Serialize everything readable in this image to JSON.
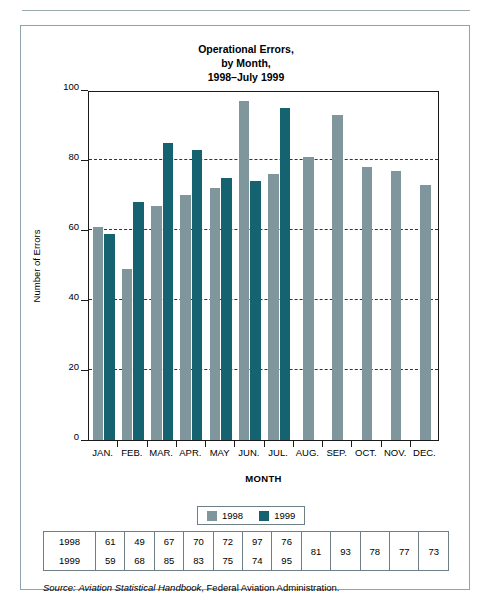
{
  "figure": {
    "title_lines": [
      "Operational Errors,",
      "by Month,",
      "1998–July 1999"
    ],
    "source_prefix": "Source:",
    "source_italic": "Aviation Statistical Handbook",
    "source_rest": ", Federal Aviation Administration."
  },
  "legend": {
    "items": [
      {
        "label": "1998",
        "color": "#7f979c"
      },
      {
        "label": "1999",
        "color": "#156370"
      }
    ]
  },
  "table": {
    "row_labels": [
      "1998",
      "1999"
    ],
    "row_1998": [
      "61",
      "49",
      "67",
      "70",
      "72",
      "97",
      "76",
      "81",
      "93",
      "78",
      "77",
      "73"
    ],
    "row_1999": [
      "59",
      "68",
      "85",
      "83",
      "75",
      "74",
      "95"
    ]
  },
  "chart_data": {
    "type": "bar",
    "title": "Operational Errors, by Month, 1998–July 1999",
    "xlabel": "MONTH",
    "ylabel": "Number of Errors",
    "categories": [
      "JAN.",
      "FEB.",
      "MAR.",
      "APR.",
      "MAY",
      "JUN.",
      "JUL.",
      "AUG.",
      "SEP.",
      "OCT.",
      "NOV.",
      "DEC."
    ],
    "series": [
      {
        "name": "1998",
        "color": "#7f979c",
        "values": [
          61,
          49,
          67,
          70,
          72,
          97,
          76,
          81,
          93,
          78,
          77,
          73
        ]
      },
      {
        "name": "1999",
        "color": "#156370",
        "values": [
          59,
          68,
          85,
          83,
          75,
          74,
          95,
          null,
          null,
          null,
          null,
          null
        ]
      }
    ],
    "ylim": [
      0,
      100
    ],
    "yticks": [
      0,
      20,
      40,
      60,
      80,
      100
    ],
    "ytick_labels": [
      "0",
      "20",
      "40",
      "60",
      "80",
      "100"
    ],
    "grid": "horizontal-dashed",
    "legend_position": "below-axis-center"
  }
}
